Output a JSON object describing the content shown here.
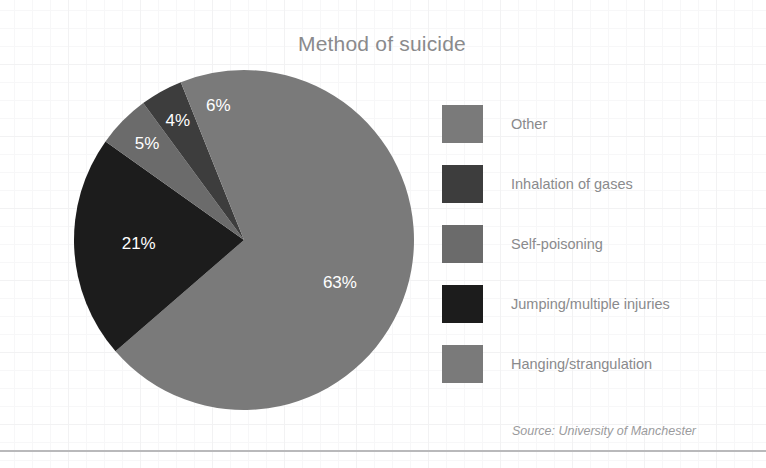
{
  "chart_data": {
    "type": "pie",
    "title": "Method of suicide",
    "source": "Source: University of Manchester",
    "legend_position": "right",
    "grid": false,
    "categories": [
      "Other",
      "Inhalation of gases",
      "Self-poisoning",
      "Jumping/multiple injuries",
      "Hanging/strangulation"
    ],
    "values": [
      6,
      4,
      5,
      21,
      63
    ],
    "value_labels": [
      "6%",
      "4%",
      "5%",
      "21%",
      "63%"
    ],
    "colors": [
      "#7a7a7a",
      "#3d3d3d",
      "#6b6b6b",
      "#1c1c1c",
      "#7a7a7a"
    ],
    "slices": [
      {
        "label": "Other",
        "value": 6,
        "value_label": "6%",
        "color": "#7a7a7a"
      },
      {
        "label": "Inhalation of gases",
        "value": 4,
        "value_label": "4%",
        "color": "#3d3d3d"
      },
      {
        "label": "Self-poisoning",
        "value": 5,
        "value_label": "5%",
        "color": "#6b6b6b"
      },
      {
        "label": "Jumping/multiple injuries",
        "value": 21,
        "value_label": "21%",
        "color": "#1c1c1c"
      },
      {
        "label": "Hanging/strangulation",
        "value": 63,
        "value_label": "63%",
        "color": "#7a7a7a"
      }
    ],
    "total": 99,
    "units": "percent"
  },
  "title": "Method of suicide",
  "source": "Source: University of Manchester",
  "legend": {
    "items": [
      {
        "label": "Other",
        "color": "#7a7a7a"
      },
      {
        "label": "Inhalation of gases",
        "color": "#3d3d3d"
      },
      {
        "label": "Self-poisoning",
        "color": "#6b6b6b"
      },
      {
        "label": "Jumping/multiple injuries",
        "color": "#1c1c1c"
      },
      {
        "label": "Hanging/strangulation",
        "color": "#7a7a7a"
      }
    ]
  },
  "slice_labels": {
    "other": "6%",
    "inhalation": "4%",
    "self_poisoning": "5%",
    "jumping": "21%",
    "hanging": "63%"
  }
}
